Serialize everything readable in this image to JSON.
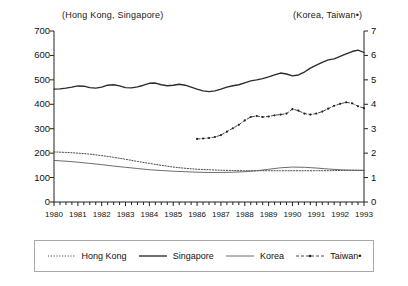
{
  "header": {
    "left_axis_title": "(Hong Kong, Singapore)",
    "right_axis_title": "(Korea, Taiwan•)"
  },
  "legend": {
    "items": [
      {
        "label": "Hong Kong",
        "style": "dotted",
        "marker": "none",
        "color": "#444444"
      },
      {
        "label": "Singapore",
        "style": "solid-thick",
        "marker": "none",
        "color": "#333333"
      },
      {
        "label": "Korea",
        "style": "solid-thin",
        "marker": "none",
        "color": "#555555"
      },
      {
        "label": "Taiwan•",
        "style": "dash-dot",
        "marker": "dot",
        "color": "#333333"
      }
    ]
  },
  "chart_data": {
    "type": "line",
    "title": "",
    "xlabel": "",
    "ylabel": "",
    "grid": false,
    "legend_position": "bottom",
    "x": [
      1980,
      1981,
      1982,
      1983,
      1984,
      1985,
      1986,
      1987,
      1988,
      1989,
      1990,
      1991,
      1992,
      1993
    ],
    "xlim": [
      1980,
      1993
    ],
    "xticklabels": [
      "1980",
      "1981",
      "1982",
      "1983",
      "1984",
      "1985",
      "1986",
      "1987",
      "1988",
      "1989",
      "1990",
      "1991",
      "1992",
      "1993"
    ],
    "x_minor_ticks_per_year": 4,
    "left_axis": {
      "label": "(Hong Kong, Singapore)",
      "ylim": [
        0,
        700
      ],
      "yticks": [
        0,
        100,
        200,
        300,
        400,
        500,
        600,
        700
      ],
      "yticklabels": [
        "0",
        "100",
        "200",
        "300",
        "400",
        "500",
        "600",
        "700"
      ]
    },
    "right_axis": {
      "label": "(Korea, Taiwan•)",
      "ylim": [
        0,
        7
      ],
      "yticks": [
        0,
        1,
        2,
        3,
        4,
        5,
        6,
        7
      ],
      "yticklabels": [
        "0",
        "1",
        "2",
        "3",
        "4",
        "5",
        "6",
        "7"
      ]
    },
    "series": [
      {
        "name": "Hong Kong",
        "axis": "left",
        "style": "dotted",
        "x": [
          1980.0,
          1980.5,
          1981.0,
          1981.5,
          1982.0,
          1982.5,
          1983.0,
          1983.5,
          1984.0,
          1984.5,
          1985.0,
          1985.5,
          1986.0,
          1986.5,
          1987.0,
          1987.5,
          1988.0,
          1988.5,
          1989.0,
          1989.5,
          1990.0,
          1990.5,
          1991.0,
          1991.5,
          1992.0,
          1992.5,
          1993.0
        ],
        "values": [
          205,
          203,
          200,
          196,
          190,
          183,
          175,
          166,
          158,
          150,
          143,
          138,
          134,
          132,
          130,
          129,
          128,
          128,
          128,
          128,
          128,
          128,
          128,
          128,
          129,
          130,
          130
        ]
      },
      {
        "name": "Singapore",
        "axis": "left",
        "style": "solid-thick",
        "x": [
          1980.0,
          1980.25,
          1980.5,
          1980.75,
          1981.0,
          1981.25,
          1981.5,
          1981.75,
          1982.0,
          1982.25,
          1982.5,
          1982.75,
          1983.0,
          1983.25,
          1983.5,
          1983.75,
          1984.0,
          1984.25,
          1984.5,
          1984.75,
          1985.0,
          1985.25,
          1985.5,
          1985.75,
          1986.0,
          1986.25,
          1986.5,
          1986.75,
          1987.0,
          1987.25,
          1987.5,
          1987.75,
          1988.0,
          1988.25,
          1988.5,
          1988.75,
          1989.0,
          1989.25,
          1989.5,
          1989.75,
          1990.0,
          1990.25,
          1990.5,
          1990.75,
          1991.0,
          1991.25,
          1991.5,
          1991.75,
          1992.0,
          1992.25,
          1992.5,
          1992.75,
          1993.0
        ],
        "values": [
          462,
          463,
          466,
          470,
          475,
          474,
          468,
          466,
          470,
          478,
          480,
          475,
          468,
          467,
          471,
          478,
          486,
          487,
          480,
          476,
          478,
          482,
          478,
          470,
          462,
          455,
          452,
          455,
          462,
          470,
          476,
          480,
          488,
          496,
          500,
          505,
          512,
          520,
          528,
          524,
          516,
          520,
          532,
          548,
          560,
          572,
          582,
          586,
          596,
          606,
          616,
          622,
          612
        ]
      },
      {
        "name": "Korea",
        "axis": "right",
        "style": "solid-thin",
        "x": [
          1980.0,
          1980.5,
          1981.0,
          1981.5,
          1982.0,
          1982.5,
          1983.0,
          1983.5,
          1984.0,
          1984.5,
          1985.0,
          1985.5,
          1986.0,
          1986.5,
          1987.0,
          1987.5,
          1988.0,
          1988.5,
          1989.0,
          1989.5,
          1990.0,
          1990.5,
          1991.0,
          1991.5,
          1992.0,
          1992.5,
          1993.0
        ],
        "values": [
          1.7,
          1.67,
          1.63,
          1.58,
          1.53,
          1.47,
          1.42,
          1.37,
          1.32,
          1.29,
          1.26,
          1.24,
          1.22,
          1.21,
          1.21,
          1.22,
          1.24,
          1.28,
          1.34,
          1.4,
          1.43,
          1.42,
          1.39,
          1.35,
          1.32,
          1.3,
          1.29
        ]
      },
      {
        "name": "Taiwan•",
        "axis": "right",
        "style": "dash-dot",
        "marker": "dot",
        "x": [
          1986.0,
          1986.25,
          1986.5,
          1986.75,
          1987.0,
          1987.25,
          1987.5,
          1987.75,
          1988.0,
          1988.25,
          1988.5,
          1988.75,
          1989.0,
          1989.25,
          1989.5,
          1989.75,
          1990.0,
          1990.25,
          1990.5,
          1990.75,
          1991.0,
          1991.25,
          1991.5,
          1991.75,
          1992.0,
          1992.25,
          1992.5,
          1992.75,
          1993.0
        ],
        "values": [
          2.58,
          2.6,
          2.62,
          2.66,
          2.74,
          2.88,
          3.02,
          3.16,
          3.34,
          3.48,
          3.52,
          3.48,
          3.5,
          3.55,
          3.58,
          3.62,
          3.8,
          3.74,
          3.62,
          3.58,
          3.62,
          3.7,
          3.82,
          3.94,
          4.02,
          4.08,
          4.04,
          3.92,
          3.84
        ]
      }
    ]
  }
}
